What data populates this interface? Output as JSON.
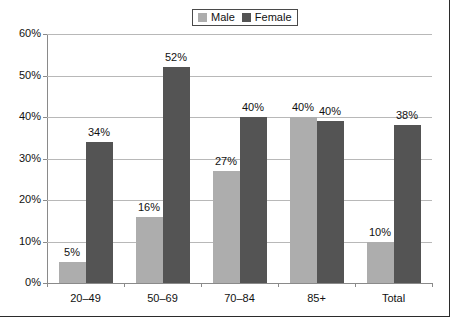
{
  "chart_data": {
    "type": "bar",
    "title": "",
    "xlabel": "",
    "ylabel": "",
    "categories": [
      "20–49",
      "50–69",
      "70–84",
      "85+",
      "Total"
    ],
    "series": [
      {
        "name": "Male",
        "color": "#adadad",
        "values": [
          5,
          16,
          27,
          40,
          10
        ],
        "labels": [
          "5%",
          "16%",
          "27%",
          "40%",
          "10%"
        ]
      },
      {
        "name": "Female",
        "color": "#545454",
        "values": [
          34,
          52,
          40,
          39,
          38
        ],
        "labels": [
          "34%",
          "52%",
          "40%",
          "40%",
          "38%"
        ]
      }
    ],
    "ylim": [
      0,
      60
    ],
    "ytick_values": [
      0,
      10,
      20,
      30,
      40,
      50,
      60
    ],
    "ytick_labels": [
      "0%",
      "10%",
      "20%",
      "30%",
      "40%",
      "50%",
      "60%"
    ],
    "grid": true,
    "legend_position": "top-center"
  },
  "legend": {
    "entries": [
      {
        "label": "Male",
        "color": "#adadad"
      },
      {
        "label": "Female",
        "color": "#545454"
      }
    ]
  },
  "colors": {
    "male": "#adadad",
    "female": "#545454",
    "gridline": "#b8b8b8",
    "axis": "#8a8a8a",
    "text": "#111111",
    "frame": "#2b2b2b",
    "background": "#ffffff"
  }
}
